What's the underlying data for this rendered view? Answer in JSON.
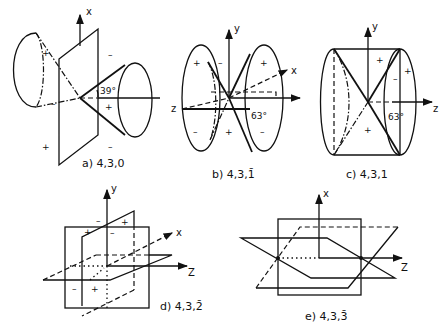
{
  "figure": {
    "panels": [
      {
        "id": "a",
        "caption": "a)  4,3,0",
        "axes": [
          "x",
          "z"
        ],
        "angle": "39°",
        "signs": [
          "+",
          "-",
          "-",
          "+",
          "+",
          "-"
        ]
      },
      {
        "id": "b",
        "caption": "b)  4,3,1̄",
        "axes": [
          "y",
          "x",
          "z"
        ],
        "angle": "63°",
        "signs": [
          "+",
          "-",
          "+",
          "-",
          "+",
          "-"
        ]
      },
      {
        "id": "c",
        "caption": "c)  4,3,1",
        "axes": [
          "y",
          "z"
        ],
        "angle": "63°",
        "signs": [
          "+",
          "+",
          "-",
          "+"
        ]
      },
      {
        "id": "d",
        "caption": "d)  4,3,2̄",
        "axes": [
          "y",
          "x",
          "z"
        ],
        "signs": [
          "-",
          "+",
          "+",
          "-",
          "-",
          "+"
        ]
      },
      {
        "id": "e",
        "caption": "e)  4,3,3̄",
        "axes": [
          "x",
          "z"
        ]
      }
    ]
  }
}
